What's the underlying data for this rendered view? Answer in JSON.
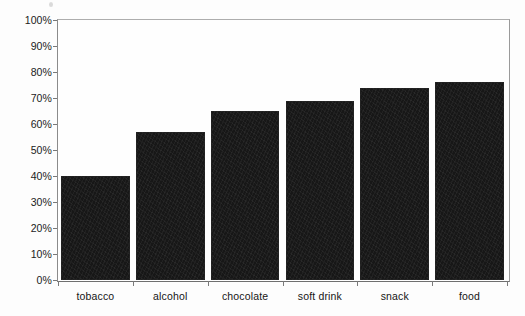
{
  "chart_data": {
    "type": "bar",
    "title": "",
    "subtitle": "",
    "xlabel": "",
    "ylabel": "",
    "categories": [
      "tobacco",
      "alcohol",
      "chocolate",
      "soft drink",
      "snack",
      "food"
    ],
    "values": [
      40,
      57,
      65,
      69,
      74,
      76
    ],
    "value_unit": "%",
    "ylim": [
      0,
      100
    ],
    "ytick_labels": [
      "100%",
      "90%",
      "80%",
      "70%",
      "60%",
      "50%",
      "40%",
      "30%",
      "20%",
      "10%",
      "0%"
    ],
    "ytick_values": [
      100,
      90,
      80,
      70,
      60,
      50,
      40,
      30,
      20,
      10,
      0
    ],
    "grid": false,
    "legend": false,
    "legend_position": "none",
    "series": [
      {
        "name": "",
        "values": [
          40,
          57,
          65,
          69,
          74,
          76
        ],
        "color": "#171717"
      }
    ]
  },
  "colors": {
    "bar": "#171717",
    "axis": "#7a7a7a",
    "text": "#161616",
    "background": "#fdfdfd"
  }
}
